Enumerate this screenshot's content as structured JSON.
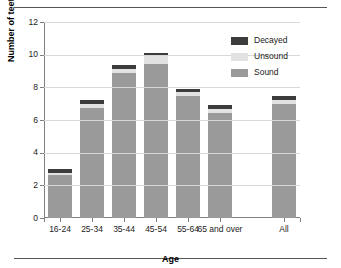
{
  "chart_data": {
    "type": "bar",
    "title": "",
    "xlabel": "Age",
    "ylabel": "Number of teeth",
    "ylim": [
      0,
      12
    ],
    "yticks": [
      0,
      2,
      4,
      6,
      8,
      10,
      12
    ],
    "grid": true,
    "stacked": true,
    "legend_position": "top-right",
    "categories": [
      "16-24",
      "25-34",
      "35-44",
      "45-54",
      "55-64",
      "65 and over",
      "All"
    ],
    "series": [
      {
        "name": "Sound",
        "color": "#9a9a9a",
        "values": [
          2.65,
          6.75,
          8.85,
          9.45,
          7.45,
          6.45,
          6.95
        ]
      },
      {
        "name": "Unsound",
        "color": "#e2e2e2",
        "values": [
          0.1,
          0.25,
          0.3,
          0.45,
          0.25,
          0.25,
          0.25
        ]
      },
      {
        "name": "Decayed",
        "color": "#3c3c3c",
        "values": [
          0.25,
          0.2,
          0.2,
          0.2,
          0.2,
          0.25,
          0.25
        ]
      }
    ],
    "totals": [
      3.0,
      7.2,
      9.35,
      10.1,
      7.9,
      6.95,
      7.45
    ]
  },
  "legend": {
    "items": [
      {
        "label": "Decayed",
        "color": "#3c3c3c"
      },
      {
        "label": "Unsound",
        "color": "#e2e2e2"
      },
      {
        "label": "Sound",
        "color": "#9a9a9a"
      }
    ]
  },
  "axes": {
    "y_title": "Number of teeth",
    "x_title": "Age",
    "y_ticks": [
      "0",
      "2",
      "4",
      "6",
      "8",
      "10",
      "12"
    ],
    "x_ticks": [
      "16-24",
      "25-34",
      "35-44",
      "45-54",
      "55-64",
      "65 and over",
      "All"
    ]
  }
}
